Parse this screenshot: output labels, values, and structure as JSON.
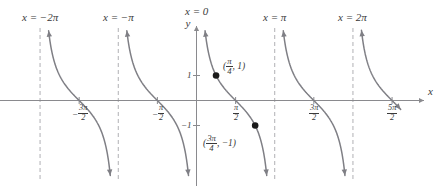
{
  "chart_data": {
    "type": "line",
    "title": "",
    "function": "y = cot(x)",
    "xlabel": "x",
    "ylabel": "y",
    "xlim": [
      -7.46,
      8.2
    ],
    "ylim": [
      -2.35,
      2.35
    ],
    "grid": false,
    "legend": null,
    "asymptotes": [
      {
        "x": -6.2832,
        "label_html": "x = −2π",
        "label": "x = -2pi"
      },
      {
        "x": -3.1416,
        "label_html": "x = −π",
        "label": "x = -pi"
      },
      {
        "x": 0.0,
        "label_html": "x = 0",
        "label": "x = 0"
      },
      {
        "x": 3.1416,
        "label_html": "x = π",
        "label": "x = pi"
      },
      {
        "x": 6.2832,
        "label_html": "x = 2π",
        "label": "x = 2pi"
      }
    ],
    "xticks": [
      {
        "x": -4.7124,
        "num": "3π",
        "den": "2",
        "sign": "−",
        "label": "-3pi/2"
      },
      {
        "x": -1.5708,
        "num": "π",
        "den": "2",
        "sign": "−",
        "label": "-pi/2"
      },
      {
        "x": 1.5708,
        "num": "π",
        "den": "2",
        "sign": "",
        "label": "pi/2"
      },
      {
        "x": 4.7124,
        "num": "3π",
        "den": "2",
        "sign": "",
        "label": "3pi/2"
      },
      {
        "x": 7.854,
        "num": "5π",
        "den": "2",
        "sign": "",
        "label": "5pi/2"
      }
    ],
    "yticks": [
      {
        "y": 1,
        "label": "1"
      },
      {
        "y": -1,
        "label": "−1"
      }
    ],
    "points": [
      {
        "x": 0.7854,
        "y": 1,
        "label_x_num": "π",
        "label_x_den": "4",
        "label_y": "1",
        "label": "(pi/4, 1)"
      },
      {
        "x": 2.3562,
        "y": -1,
        "label_x_num": "3π",
        "label_x_den": "4",
        "label_y": "−1",
        "label": "(3pi/4, -1)"
      }
    ],
    "branches": [
      {
        "domain": [
          -6.2832,
          -3.1416
        ]
      },
      {
        "domain": [
          -3.1416,
          0.0
        ]
      },
      {
        "domain": [
          0.0,
          3.1416
        ]
      },
      {
        "domain": [
          3.1416,
          6.2832
        ]
      },
      {
        "domain": [
          6.2832,
          8.2
        ]
      }
    ]
  },
  "axes": {
    "y_axis_label": "y",
    "x_axis_label": "x"
  },
  "colors": {
    "curve": "#7f7f85",
    "axis": "#8a8a8e",
    "asymptote": "#b0b0b4",
    "point": "#1a1a1a",
    "text": "#3a3a3a",
    "background": "#ffffff"
  }
}
